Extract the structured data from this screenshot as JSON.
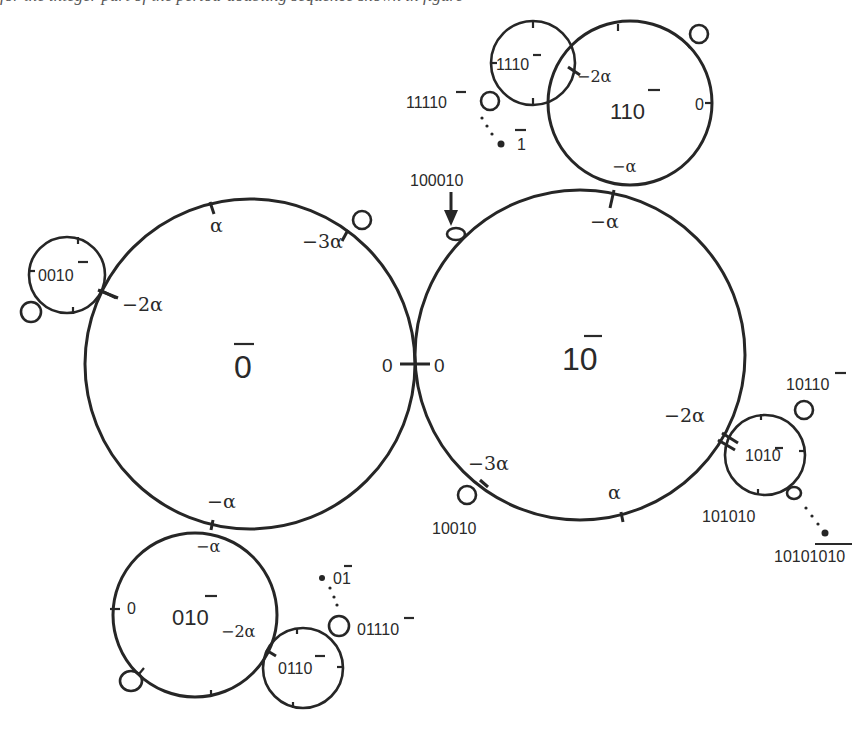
{
  "caption": "for the integer part of the period-doubling sequence shown in figure",
  "diagram": {
    "type": "circle-tangency-diagram",
    "circles": [
      {
        "id": "c0bar",
        "label": "0",
        "overline": "0",
        "display": "0̄",
        "cx": 250,
        "cy": 364,
        "r": 165
      },
      {
        "id": "c10bar",
        "label": "10",
        "display": "10̄",
        "cx": 580,
        "cy": 355,
        "r": 165
      },
      {
        "id": "c110bar",
        "label": "110",
        "display": "110̄",
        "cx": 630,
        "cy": 103,
        "r": 82
      },
      {
        "id": "c1110bar",
        "label": "1110",
        "display": "1110̄",
        "cx": 533,
        "cy": 63,
        "r": 42
      },
      {
        "id": "c0010bar",
        "label": "0010",
        "display": "0010̄",
        "cx": 67,
        "cy": 275,
        "r": 38
      },
      {
        "id": "c010bar",
        "label": "010",
        "display": "010̄",
        "cx": 195,
        "cy": 615,
        "r": 82
      },
      {
        "id": "c0110bar",
        "label": "0110",
        "display": "0110̄",
        "cx": 303,
        "cy": 668,
        "r": 40
      },
      {
        "id": "c1010bar",
        "label": "1010",
        "display": "1010̄",
        "cx": 765,
        "cy": 455,
        "r": 40
      }
    ],
    "center_labels": {
      "c0bar": "0",
      "c10bar": "10",
      "c110bar": "110",
      "c1110bar": "1110",
      "c0010bar": "0010",
      "c010bar": "010",
      "c0110bar": "0110",
      "c1010bar": "1010"
    },
    "tick_labels": {
      "c0bar_alpha": "α",
      "c0bar_m3alpha": "−3α",
      "c0bar_m2alpha": "−2α",
      "c0bar_0": "0",
      "c0bar_malpha": "−α",
      "c10bar_0": "0",
      "c10bar_malpha": "−α",
      "c10bar_m2alpha": "−2α",
      "c10bar_m3alpha": "−3α",
      "c10bar_alpha": "α",
      "c110bar_m2alpha": "−2α",
      "c110bar_0": "0",
      "c110bar_malpha": "−α",
      "c010bar_malpha": "−α",
      "c010bar_0": "0",
      "c010bar_m2alpha": "−2α"
    },
    "point_labels": {
      "p11110bar": "11110",
      "p1bar": "1",
      "p100010bar": "100010",
      "p10010bar": "10010",
      "p10110bar": "10110",
      "p101010bar": "101010",
      "p1010_10bar": "10101010",
      "p01bar": "01",
      "p01110bar": "01110"
    },
    "stroke_color": "#262626",
    "background": "#ffffff"
  }
}
